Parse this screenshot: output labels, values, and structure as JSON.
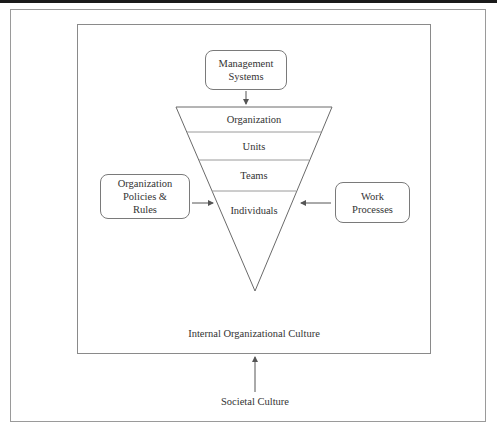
{
  "diagram": {
    "influences": {
      "top": {
        "line1": "Management",
        "line2": "Systems"
      },
      "left": {
        "line1": "Organization",
        "line2": "Policies &",
        "line3": "Rules"
      },
      "right": {
        "line1": "Work",
        "line2": "Processes"
      }
    },
    "funnel_levels": [
      "Organization",
      "Units",
      "Teams",
      "Individuals"
    ],
    "inner_frame_label": "Internal Organizational Culture",
    "outer_source_label": "Societal Culture"
  }
}
